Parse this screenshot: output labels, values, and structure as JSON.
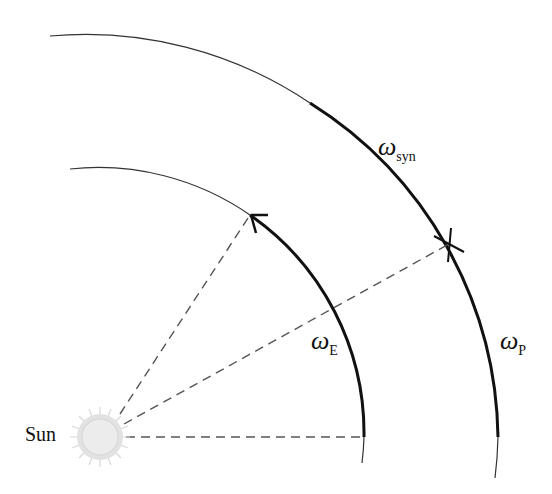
{
  "diagram": {
    "title": "",
    "labels": {
      "sun": "Sun",
      "omega_syn": {
        "symbol": "ω",
        "subscript": "syn"
      },
      "omega_E": {
        "symbol": "ω",
        "subscript": "E"
      },
      "omega_P": {
        "symbol": "ω",
        "subscript": "P"
      }
    },
    "nodes": [
      {
        "id": "sun",
        "label": "Sun",
        "type": "star"
      },
      {
        "id": "inner-orbit",
        "label": "Earth orbit",
        "type": "arc"
      },
      {
        "id": "outer-orbit",
        "label": "Planet orbit",
        "type": "arc"
      }
    ],
    "edges": [
      {
        "from": "sun",
        "to": "inner-orbit-start",
        "style": "dashed"
      },
      {
        "from": "sun",
        "to": "inner-orbit-arrow",
        "style": "dashed"
      },
      {
        "from": "sun",
        "to": "outer-orbit-marker",
        "style": "dashed"
      }
    ],
    "colors": {
      "line": "#111111",
      "dash": "#555555",
      "sun": "#cfcfcf"
    }
  }
}
